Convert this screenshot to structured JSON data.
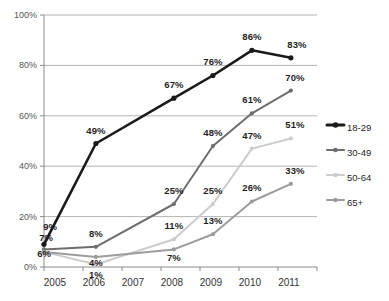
{
  "chart_data": {
    "type": "line",
    "title": "",
    "subtitle": "",
    "xlabel": "",
    "ylabel": "",
    "categories": [
      "2005",
      "2006",
      "2007",
      "2008",
      "2009",
      "2010",
      "2011"
    ],
    "x": [
      2005,
      2006,
      2007,
      2008,
      2009,
      2010,
      2011
    ],
    "ylim": [
      0,
      100
    ],
    "yticks": [
      "0%",
      "20%",
      "40%",
      "60%",
      "80%",
      "100%"
    ],
    "ytick_values": [
      0,
      20,
      40,
      60,
      80,
      100
    ],
    "grid": true,
    "legend_position": "right",
    "series": [
      {
        "name": "18-29",
        "color": "#1a1a1a",
        "values": [
          9,
          49,
          null,
          67,
          76,
          86,
          83
        ],
        "labels": [
          "9%",
          "49%",
          "",
          "67%",
          "76%",
          "86%",
          "83%"
        ]
      },
      {
        "name": "30-49",
        "color": "#6e6e6e",
        "values": [
          7,
          8,
          null,
          25,
          48,
          61,
          70
        ],
        "labels": [
          "7%",
          "8%",
          "",
          "25%",
          "48%",
          "61%",
          "70%"
        ]
      },
      {
        "name": "50-64",
        "color": "#cccccc",
        "values": [
          6,
          1,
          null,
          11,
          25,
          47,
          51
        ],
        "labels": [
          "6%",
          "1%",
          "",
          "11%",
          "25%",
          "47%",
          "51%"
        ]
      },
      {
        "name": "65+",
        "color": "#9c9c9c",
        "values": [
          6,
          4,
          null,
          7,
          13,
          26,
          33
        ],
        "labels": [
          "",
          "4%",
          "",
          "7%",
          "13%",
          "26%",
          "33%"
        ]
      }
    ],
    "legend": [
      {
        "label": "18-29",
        "color": "#1a1a1a"
      },
      {
        "label": "30-49",
        "color": "#6e6e6e"
      },
      {
        "label": "50-64",
        "color": "#cccccc"
      },
      {
        "label": "65+",
        "color": "#9c9c9c"
      }
    ]
  }
}
